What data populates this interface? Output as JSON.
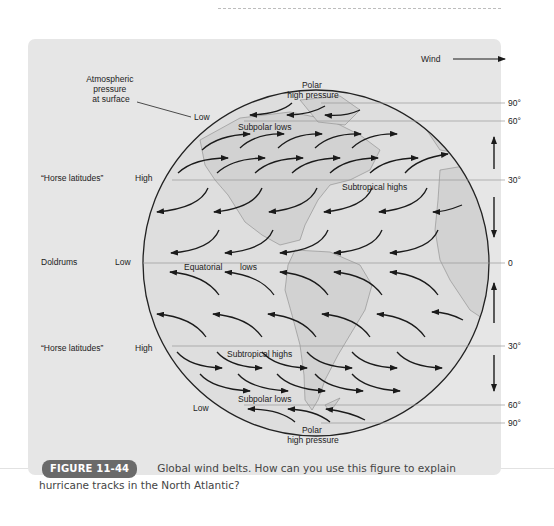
{
  "diagram": {
    "legend": {
      "label": "Wind",
      "icon": "arrow-right-icon"
    },
    "annotation": {
      "text_lines": [
        "Atmospheric",
        "pressure",
        "at surface"
      ]
    },
    "left_labels": [
      {
        "zone": "“Horse latitudes”",
        "pressure": "High"
      },
      {
        "zone": "Doldrums",
        "pressure": "Low"
      },
      {
        "zone": "“Horse latitudes”",
        "pressure": "High"
      }
    ],
    "pressure_labels": {
      "north_pole_low": "Low",
      "south_low": "Low"
    },
    "belt_labels": {
      "polar_high_north": [
        "Polar",
        "high pressure"
      ],
      "subpolar_lows_north": "Subpolar lows",
      "subtropical_highs_north": "Subtropical highs",
      "equatorial_lows": [
        "Equatorial",
        "lows"
      ],
      "subtropical_highs_south": "Subtropical highs",
      "subpolar_lows_south": "Subpolar lows",
      "polar_high_south": [
        "Polar",
        "high pressure"
      ]
    },
    "latitude_labels": [
      "90°",
      "60°",
      "30°",
      "0",
      "30°",
      "60°",
      "90°"
    ],
    "colors": {
      "panel": "#e6e6e6",
      "globe": "#dcdcdc",
      "land": "#d0d0d0",
      "arrow": "#1a1a1a",
      "lat_line": "#9a9a9a"
    }
  },
  "caption": {
    "badge": "FIGURE 11-44",
    "text": "Global wind belts. How can you use this figure to explain hurricane tracks in the North Atlantic?"
  }
}
